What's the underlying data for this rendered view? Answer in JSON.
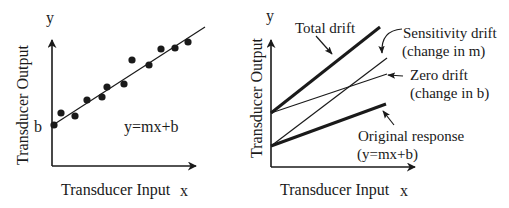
{
  "left_panel": {
    "y_axis_symbol": "y",
    "x_axis_symbol": "x",
    "y_axis_label": "Transducer Output",
    "x_axis_label": "Transducer Input",
    "intercept_label": "b",
    "equation": "y=mx+b"
  },
  "right_panel": {
    "y_axis_symbol": "y",
    "x_axis_symbol": "x",
    "y_axis_label": "Transducer Output",
    "x_axis_label": "Transducer Input",
    "total_drift": "Total drift",
    "sensitivity_drift_line1": "Sensitivity drift",
    "sensitivity_drift_line2": "(change in m)",
    "zero_drift_line1": "Zero drift",
    "zero_drift_line2": "(change in b)",
    "original_line1": "Original response",
    "original_line2": "(y=mx+b)"
  },
  "colors": {
    "ink": "#1a1a1a",
    "background": "#ffffff"
  }
}
